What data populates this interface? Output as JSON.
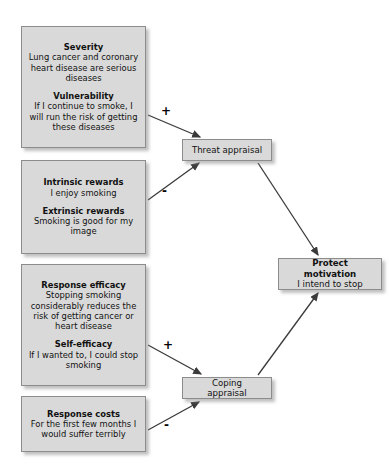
{
  "diagram": {
    "colors": {
      "node_fill": "#d9d9d9",
      "node_border": "#8c8c8c",
      "arrow": "#3a3a3a",
      "background": "#ffffff",
      "text": "#111111"
    },
    "nodes": [
      {
        "id": "threat-vulnerability",
        "blocks": [
          {
            "title": "Severity",
            "text": "Lung cancer and coronary heart disease are serious diseases"
          },
          {
            "title": "Vulnerability",
            "text": "If I continue to smoke, I will run the risk of getting these diseases"
          }
        ]
      },
      {
        "id": "rewards",
        "blocks": [
          {
            "title": "Intrinsic rewards",
            "text": "I enjoy smoking"
          },
          {
            "title": "Extrinsic rewards",
            "text": "Smoking is good for my image"
          }
        ]
      },
      {
        "id": "efficacy",
        "blocks": [
          {
            "title": "Response efficacy",
            "text": "Stopping smoking considerably reduces the risk of getting cancer or heart disease"
          },
          {
            "title": "Self-efficacy",
            "text": "If I wanted to, I could stop smoking"
          }
        ]
      },
      {
        "id": "response-costs",
        "blocks": [
          {
            "title": "Response costs",
            "text": "For the first few months I would suffer terribly"
          }
        ]
      }
    ],
    "appraisals": {
      "threat": {
        "label": "Threat appraisal"
      },
      "coping": {
        "label": "Coping appraisal"
      },
      "protect_motivation": {
        "title": "Protect motivation",
        "text": "I intend to stop"
      }
    },
    "edges": [
      {
        "id": "severity-to-threat",
        "from": "threat-vulnerability",
        "to": "threat-appraisal",
        "sign": "+"
      },
      {
        "id": "rewards-to-threat",
        "from": "rewards",
        "to": "threat-appraisal",
        "sign": "-"
      },
      {
        "id": "efficacy-to-coping",
        "from": "efficacy",
        "to": "coping-appraisal",
        "sign": "+"
      },
      {
        "id": "costs-to-coping",
        "from": "response-costs",
        "to": "coping-appraisal",
        "sign": "-"
      },
      {
        "id": "threat-to-motivation",
        "from": "threat-appraisal",
        "to": "protect-motivation",
        "sign": ""
      },
      {
        "id": "coping-to-motivation",
        "from": "coping-appraisal",
        "to": "protect-motivation",
        "sign": ""
      }
    ]
  }
}
